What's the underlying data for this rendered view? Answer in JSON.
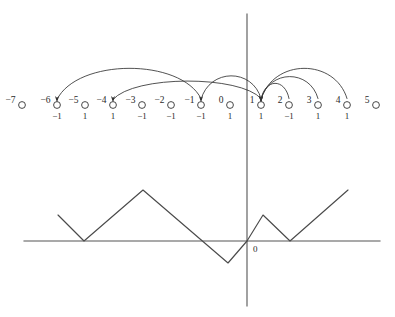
{
  "figure": {
    "background_color": "#ffffff",
    "ink_color": "#333333",
    "axis_color": "#555555"
  },
  "number_line": {
    "description": "Row of open circles labelled with integers, each with a value below it",
    "y_circle": 105,
    "y_main_label": 103,
    "y_sub_label": 119,
    "circle_radius": 3.4,
    "points": [
      {
        "label": "−7",
        "x": 22,
        "sub": "",
        "has_sub": false
      },
      {
        "label": "−6",
        "x": 57,
        "sub": "−1",
        "has_sub": true
      },
      {
        "label": "−5",
        "x": 85,
        "sub": "1",
        "has_sub": true
      },
      {
        "label": "−4",
        "x": 113,
        "sub": "1",
        "has_sub": true
      },
      {
        "label": "−3",
        "x": 142,
        "sub": "−1",
        "has_sub": true
      },
      {
        "label": "−2",
        "x": 171,
        "sub": "−1",
        "has_sub": true
      },
      {
        "label": "−1",
        "x": 201,
        "sub": "−1",
        "has_sub": true
      },
      {
        "label": "0",
        "x": 230,
        "sub": "1",
        "has_sub": true
      },
      {
        "label": "1",
        "x": 261,
        "sub": "1",
        "has_sub": true
      },
      {
        "label": "2",
        "x": 289,
        "sub": "−1",
        "has_sub": true
      },
      {
        "label": "3",
        "x": 318,
        "sub": "1",
        "has_sub": true
      },
      {
        "label": "4",
        "x": 347,
        "sub": "1",
        "has_sub": true
      },
      {
        "label": "5",
        "x": 376,
        "sub": "",
        "has_sub": false
      }
    ]
  },
  "arcs": {
    "description": "Curved arrows mapping one integer node to another, arrowheads at the target",
    "items": [
      {
        "name": "arc-minus1-to-minus6",
        "from": "−1",
        "to": "−6",
        "from_x": 201,
        "to_x": 57,
        "apex_y": 58,
        "arrow_at": "target"
      },
      {
        "name": "arc-1-to-minus4",
        "from": "1",
        "to": "−4",
        "from_x": 261,
        "to_x": 113,
        "apex_y": 75,
        "arrow_at": "target"
      },
      {
        "name": "arc-1-to-minus1",
        "from": "1",
        "to": "−1",
        "from_x": 261,
        "to_x": 201,
        "apex_y": 68,
        "arrow_at": "target"
      },
      {
        "name": "arc-2-to-1",
        "from": "2",
        "to": "1",
        "from_x": 289,
        "to_x": 261,
        "apex_y": 78,
        "arrow_at": "target"
      },
      {
        "name": "arc-3-to-1",
        "from": "3",
        "to": "1",
        "from_x": 318,
        "to_x": 261,
        "apex_y": 69,
        "arrow_at": "target"
      },
      {
        "name": "arc-4-to-1",
        "from": "4",
        "to": "1",
        "from_x": 347,
        "to_x": 261,
        "apex_y": 58,
        "arrow_at": "target"
      }
    ]
  },
  "graph": {
    "description": "Piecewise-linear zigzag waveform drawn on a horizontal axis with a vertical axis through the origin",
    "origin_label": "0",
    "horizontal_axis": {
      "x1": 24,
      "x2": 380,
      "y": 241
    },
    "vertical_axis": {
      "x": 247,
      "y1": 14,
      "y2": 306
    },
    "vertices": [
      {
        "x": 58,
        "y": 215
      },
      {
        "x": 84,
        "y": 241
      },
      {
        "x": 143,
        "y": 190
      },
      {
        "x": 228,
        "y": 263
      },
      {
        "x": 247,
        "y": 241
      },
      {
        "x": 263,
        "y": 215
      },
      {
        "x": 290,
        "y": 241
      },
      {
        "x": 348,
        "y": 190
      }
    ]
  }
}
